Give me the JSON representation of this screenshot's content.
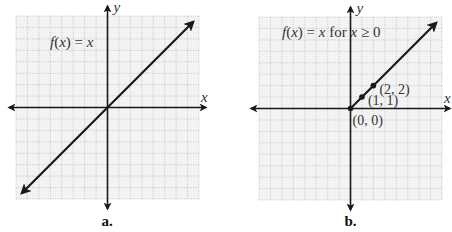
{
  "chart_data": [
    {
      "type": "line",
      "panel_label": "a.",
      "title": "f(x) = x",
      "title_parts": {
        "fn": "f",
        "arg": "x",
        "rhs": "x",
        "suffix": ""
      },
      "xlabel": "x",
      "ylabel": "y",
      "xlim": [
        -8,
        8
      ],
      "ylim": [
        -8,
        8
      ],
      "grid": true,
      "grid_step": 1,
      "series": [
        {
          "name": "f(x) = x",
          "x": [
            -7.5,
            7.5
          ],
          "y": [
            -7.5,
            7.5
          ],
          "arrow_start": true,
          "arrow_end": true
        }
      ],
      "points": []
    },
    {
      "type": "line",
      "panel_label": "b.",
      "title": "f(x) = x for x ≥ 0",
      "title_parts": {
        "fn": "f",
        "arg": "x",
        "rhs": "x",
        "suffix": "for x ≥ 0"
      },
      "xlabel": "x",
      "ylabel": "y",
      "xlim": [
        -8,
        8
      ],
      "ylim": [
        -8,
        8
      ],
      "grid": true,
      "grid_step": 1,
      "series": [
        {
          "name": "f(x) = x for x ≥ 0",
          "x": [
            0,
            7.5
          ],
          "y": [
            0,
            7.5
          ],
          "arrow_start": false,
          "arrow_end": true
        }
      ],
      "points": [
        {
          "x": 0,
          "y": 0,
          "label": "(0, 0)",
          "label_pos": "below-right"
        },
        {
          "x": 1,
          "y": 1,
          "label": "(1, 1)",
          "label_pos": "right"
        },
        {
          "x": 2,
          "y": 2,
          "label": "(2, 2)",
          "label_pos": "right"
        }
      ]
    }
  ]
}
